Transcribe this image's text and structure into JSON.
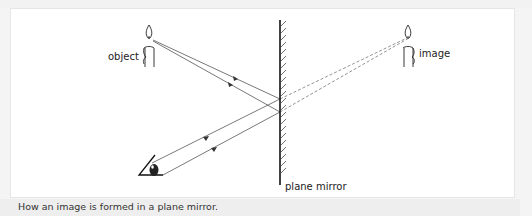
{
  "diagram": {
    "labels": {
      "object": "object",
      "image": "image",
      "mirror": "plane mirror"
    },
    "caption": "How an image is formed in a plane mirror.",
    "colors": {
      "ray": "#555555",
      "virtual_ray": "#777777",
      "mirror": "#111111",
      "background": "#ffffff",
      "caption_bar": "#eeeeee"
    },
    "elements": [
      {
        "name": "object-candle",
        "type": "candle"
      },
      {
        "name": "image-candle",
        "type": "candle"
      },
      {
        "name": "plane-mirror",
        "type": "mirror"
      },
      {
        "name": "eye",
        "type": "eye"
      },
      {
        "name": "incident-rays",
        "count": 2
      },
      {
        "name": "reflected-rays",
        "count": 2
      },
      {
        "name": "virtual-rays",
        "count": 2,
        "style": "dashed"
      }
    ]
  }
}
